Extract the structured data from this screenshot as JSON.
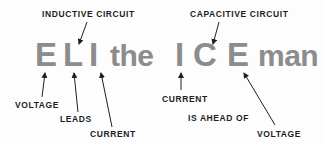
{
  "mnemonic": {
    "letters": [
      {
        "text": "E",
        "role": "emf/voltage"
      },
      {
        "text": "L",
        "role": "inductance"
      },
      {
        "text": "I",
        "role": "current"
      },
      {
        "text": "the",
        "role": "filler"
      },
      {
        "text": "I",
        "role": "current"
      },
      {
        "text": "C",
        "role": "capacitance"
      },
      {
        "text": "E",
        "role": "emf/voltage"
      },
      {
        "text": "man",
        "role": "filler"
      }
    ],
    "letter_color": "#8c8c8c"
  },
  "labels": {
    "inductive_circuit": "INDUCTIVE CIRCUIT",
    "capacitive_circuit": "CAPACITIVE CIRCUIT",
    "eli_voltage": "VOLTAGE",
    "eli_leads": "LEADS",
    "eli_current": "CURRENT",
    "ice_current": "CURRENT",
    "ice_is_ahead_of": "IS AHEAD OF",
    "ice_voltage": "VOLTAGE",
    "label_color": "#1e1e1e"
  }
}
